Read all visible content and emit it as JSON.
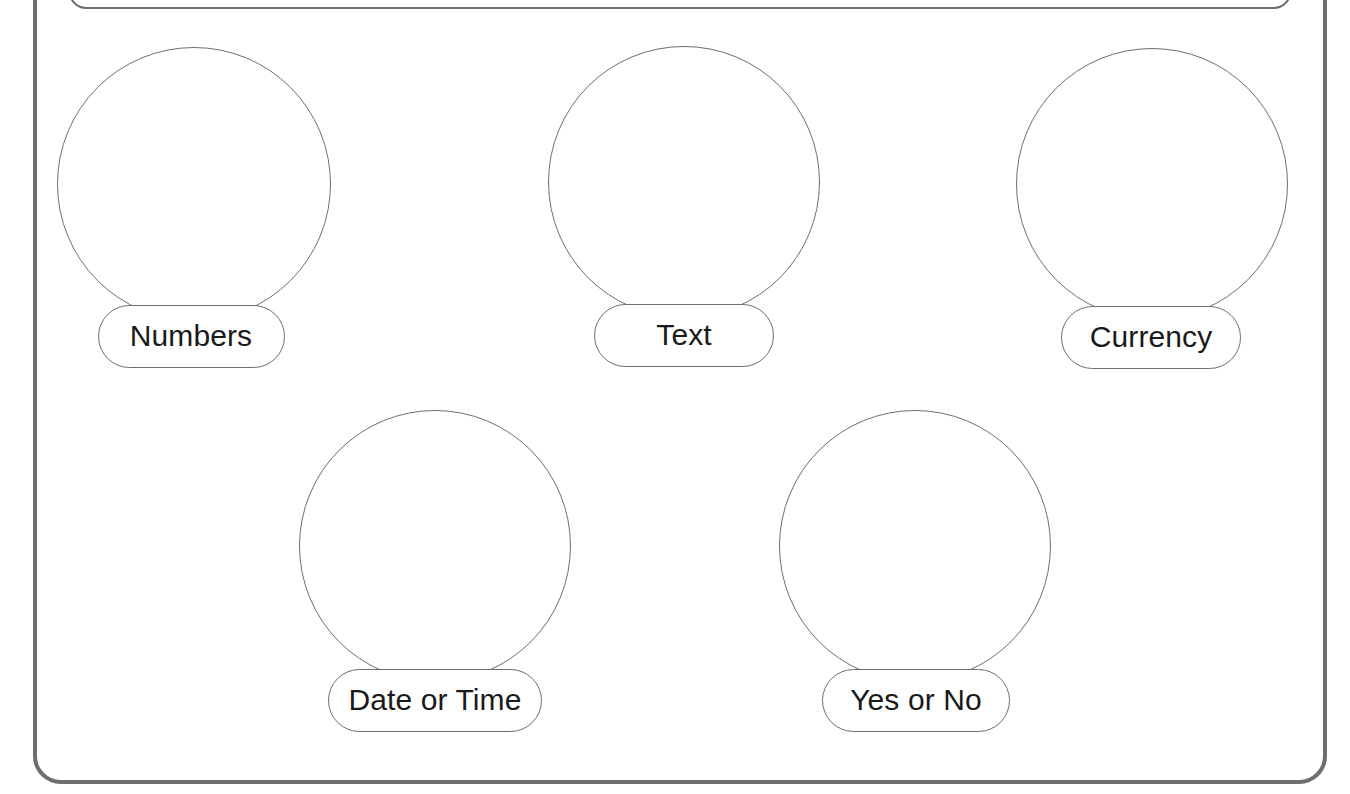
{
  "canvas": {
    "width": 1350,
    "height": 794,
    "background_color": "#ffffff",
    "stroke_color": "#6e6e6e",
    "text_color": "#1a1a1a"
  },
  "outer_frame": {
    "name": "outer-rounded-container",
    "x": 35,
    "y": -40,
    "width": 1290,
    "height": 822,
    "radius": 26,
    "stroke_color": "#6e6e6e",
    "stroke_width": 4
  },
  "inner_frame": {
    "name": "inner-rounded-panel",
    "x": 70,
    "y": -70,
    "width": 1220,
    "height": 78,
    "radius": 16,
    "stroke_color": "#6e6e6e",
    "stroke_width": 2
  },
  "diagram": {
    "type": "balloon-node-map",
    "rows": [
      {
        "name": "row-1",
        "node_indices": [
          0,
          1,
          2
        ]
      },
      {
        "name": "row-2",
        "node_indices": [
          3,
          4
        ]
      }
    ],
    "nodes": [
      {
        "id": "numbers",
        "label": "Numbers",
        "bubble": {
          "cx": 194,
          "cy": 184,
          "r": 137
        },
        "pill": {
          "cx": 191,
          "cy": 336,
          "width": 187,
          "height": 63
        }
      },
      {
        "id": "text",
        "label": "Text",
        "bubble": {
          "cx": 684,
          "cy": 182,
          "r": 136
        },
        "pill": {
          "cx": 684,
          "cy": 335,
          "width": 180,
          "height": 63
        }
      },
      {
        "id": "currency",
        "label": "Currency",
        "bubble": {
          "cx": 1152,
          "cy": 184,
          "r": 136
        },
        "pill": {
          "cx": 1151,
          "cy": 337,
          "width": 180,
          "height": 63
        }
      },
      {
        "id": "date-or-time",
        "label": "Date or Time",
        "bubble": {
          "cx": 435,
          "cy": 546,
          "r": 136
        },
        "pill": {
          "cx": 435,
          "cy": 700,
          "width": 214,
          "height": 63
        }
      },
      {
        "id": "yes-or-no",
        "label": "Yes or No",
        "bubble": {
          "cx": 915,
          "cy": 546,
          "r": 136
        },
        "pill": {
          "cx": 916,
          "cy": 700,
          "width": 188,
          "height": 63
        }
      }
    ]
  }
}
